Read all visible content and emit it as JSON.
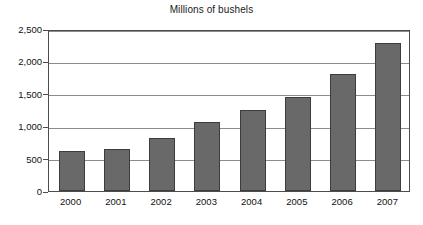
{
  "chart_data": {
    "type": "bar",
    "title": "Millions of bushels",
    "xlabel": "",
    "ylabel": "",
    "categories": [
      "2000",
      "2001",
      "2002",
      "2003",
      "2004",
      "2005",
      "2006",
      "2007"
    ],
    "values": [
      610,
      655,
      812,
      1065,
      1250,
      1445,
      1800,
      2290
    ],
    "ylim": [
      0,
      2500
    ],
    "yticks": [
      0,
      500,
      1000,
      1500,
      2000,
      2500
    ],
    "ytick_labels": [
      "0",
      "500",
      "1,000",
      "1,500",
      "2,000",
      "2,500"
    ],
    "grid": true,
    "legend": false,
    "legend_position": "none",
    "series": [
      {
        "name": "Millions of bushels",
        "values": [
          610,
          655,
          812,
          1065,
          1250,
          1445,
          1800,
          2290
        ]
      }
    ],
    "colors": {
      "bar_fill": "#696969",
      "bar_border": "#3d3d3d",
      "gridline": "#8c8c8c",
      "axis": "#4d4d4d",
      "background": "#ffffff",
      "text": "#111111"
    }
  }
}
